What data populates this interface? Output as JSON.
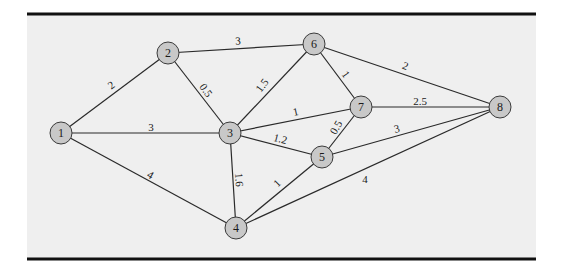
{
  "diagram": {
    "type": "weighted-undirected-graph",
    "frame": {
      "x": 27,
      "y": 14,
      "width": 509,
      "height": 245,
      "background": "#efefef",
      "rule_color": "#111111"
    },
    "node_style": {
      "fill": "#c8c8c8",
      "stroke": "#3a3a3a",
      "radius": 11
    },
    "edge_style": {
      "stroke": "#2a2a2a",
      "width": 1.2
    },
    "nodes": [
      {
        "id": "1",
        "label": "1",
        "x": 61,
        "y": 133
      },
      {
        "id": "2",
        "label": "2",
        "x": 168,
        "y": 53
      },
      {
        "id": "3",
        "label": "3",
        "x": 230,
        "y": 133
      },
      {
        "id": "4",
        "label": "4",
        "x": 236,
        "y": 228
      },
      {
        "id": "5",
        "label": "5",
        "x": 322,
        "y": 157
      },
      {
        "id": "6",
        "label": "6",
        "x": 314,
        "y": 44
      },
      {
        "id": "7",
        "label": "7",
        "x": 361,
        "y": 107
      },
      {
        "id": "8",
        "label": "8",
        "x": 500,
        "y": 107
      }
    ],
    "edges": [
      {
        "from": "1",
        "to": "2",
        "weight": "2",
        "lx": 112,
        "ly": 86,
        "rot": -37
      },
      {
        "from": "1",
        "to": "3",
        "weight": "3",
        "lx": 151,
        "ly": 128,
        "rot": 0
      },
      {
        "from": "1",
        "to": "4",
        "weight": "4",
        "lx": 150,
        "ly": 176,
        "rot": 30
      },
      {
        "from": "2",
        "to": "3",
        "weight": "0.5",
        "lx": 205,
        "ly": 91,
        "rot": 55
      },
      {
        "from": "2",
        "to": "6",
        "weight": "3",
        "lx": 238,
        "ly": 42,
        "rot": -4
      },
      {
        "from": "3",
        "to": "6",
        "weight": "1.5",
        "lx": 263,
        "ly": 86,
        "rot": -52
      },
      {
        "from": "3",
        "to": "7",
        "weight": "1",
        "lx": 296,
        "ly": 113,
        "rot": -12
      },
      {
        "from": "3",
        "to": "5",
        "weight": "1.2",
        "lx": 280,
        "ly": 140,
        "rot": 15
      },
      {
        "from": "3",
        "to": "4",
        "weight": "1.6",
        "lx": 238,
        "ly": 180,
        "rot": 85
      },
      {
        "from": "6",
        "to": "7",
        "weight": "1",
        "lx": 345,
        "ly": 75,
        "rot": 55
      },
      {
        "from": "6",
        "to": "8",
        "weight": "2",
        "lx": 405,
        "ly": 67,
        "rot": 22
      },
      {
        "from": "7",
        "to": "5",
        "weight": "0.5",
        "lx": 337,
        "ly": 128,
        "rot": -60
      },
      {
        "from": "7",
        "to": "8",
        "weight": "2.5",
        "lx": 420,
        "ly": 102,
        "rot": 0
      },
      {
        "from": "5",
        "to": "8",
        "weight": "3",
        "lx": 397,
        "ly": 130,
        "rot": -14
      },
      {
        "from": "5",
        "to": "4",
        "weight": "1",
        "lx": 278,
        "ly": 184,
        "rot": -45
      },
      {
        "from": "4",
        "to": "8",
        "weight": "4",
        "lx": 365,
        "ly": 180,
        "rot": 0
      }
    ]
  }
}
